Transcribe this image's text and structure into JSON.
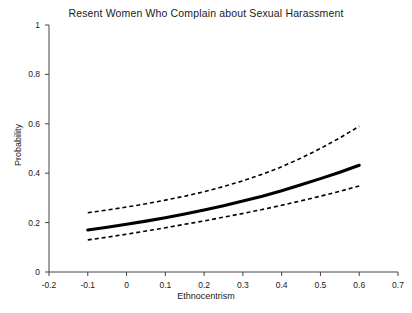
{
  "chart_data": {
    "type": "line",
    "title": "Resent Women Who Complain about Sexual Harassment",
    "xlabel": "Ethnocentrism",
    "ylabel": "Probability",
    "xlim": [
      -0.2,
      0.7
    ],
    "ylim": [
      0,
      1
    ],
    "xticks": [
      -0.2,
      -0.1,
      0,
      0.1,
      0.2,
      0.3,
      0.4,
      0.5,
      0.6,
      0.7
    ],
    "xtick_labels": [
      "-0.2",
      "-0.1",
      "0",
      "0.1",
      "0.2",
      "0.3",
      "0.4",
      "0.5",
      "0.6",
      "0.7"
    ],
    "yticks": [
      0,
      0.2,
      0.4,
      0.6,
      0.8,
      1
    ],
    "ytick_labels": [
      "0",
      "0.2",
      "0.4",
      "0.6",
      "0.8",
      "1"
    ],
    "grid": false,
    "legend": null,
    "x": [
      -0.1,
      -0.05,
      0,
      0.05,
      0.1,
      0.15,
      0.2,
      0.25,
      0.3,
      0.35,
      0.4,
      0.45,
      0.5,
      0.55,
      0.6
    ],
    "series": [
      {
        "name": "Upper confidence bound",
        "style": "dashed",
        "color": "#000000",
        "values": [
          0.24,
          0.251,
          0.263,
          0.276,
          0.291,
          0.307,
          0.325,
          0.346,
          0.369,
          0.396,
          0.426,
          0.461,
          0.5,
          0.543,
          0.59
        ]
      },
      {
        "name": "Predicted probability",
        "style": "solid",
        "color": "#000000",
        "values": [
          0.17,
          0.181,
          0.193,
          0.206,
          0.22,
          0.235,
          0.251,
          0.268,
          0.287,
          0.307,
          0.329,
          0.353,
          0.378,
          0.404,
          0.432
        ]
      },
      {
        "name": "Lower confidence bound",
        "style": "dashed",
        "color": "#000000",
        "values": [
          0.13,
          0.141,
          0.153,
          0.166,
          0.179,
          0.193,
          0.207,
          0.222,
          0.237,
          0.253,
          0.27,
          0.288,
          0.307,
          0.327,
          0.348
        ]
      }
    ],
    "solid_endpoints": {
      "x_start": -0.1,
      "y_start": 0.17,
      "x_end": 0.6,
      "y_end": 0.49
    },
    "upper_endpoints": {
      "x_start": -0.1,
      "y_start": 0.24,
      "x_end": 0.6,
      "y_end": 0.59
    },
    "lower_endpoints": {
      "x_start": -0.1,
      "y_start": 0.13,
      "x_end": 0.6,
      "y_end": 0.37
    }
  }
}
